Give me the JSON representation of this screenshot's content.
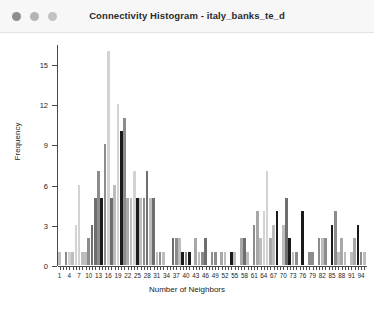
{
  "window": {
    "title": "Connectivity Histogram - italy_banks_te_d",
    "controls": [
      {
        "name": "close",
        "color": "#8e8e8e"
      },
      {
        "name": "minimize",
        "color": "#b4b4b4"
      },
      {
        "name": "maximize",
        "color": "#c2c2c2"
      }
    ]
  },
  "chart_data": {
    "type": "bar",
    "title": "Connectivity Histogram - italy_banks_te_d",
    "xlabel": "Number of Neighbors",
    "ylabel": "Frequency",
    "xlim": [
      0.5,
      95.5
    ],
    "ylim": [
      0,
      16.5
    ],
    "grid": false,
    "legend": null,
    "ytick_labels": [
      "0",
      "3",
      "6",
      "9",
      "12",
      "15"
    ],
    "ytick_values": [
      0,
      3,
      6,
      9,
      12,
      15
    ],
    "xtick_labels": [
      "1",
      "4",
      "7",
      "10",
      "13",
      "16",
      "19",
      "22",
      "25",
      "28",
      "31",
      "34",
      "37",
      "40",
      "43",
      "46",
      "49",
      "52",
      "55",
      "58",
      "61",
      "64",
      "67",
      "70",
      "73",
      "76",
      "79",
      "82",
      "85",
      "88",
      "91",
      "94"
    ],
    "xtick_values": [
      1,
      4,
      7,
      10,
      13,
      16,
      19,
      22,
      25,
      28,
      31,
      34,
      37,
      40,
      43,
      46,
      49,
      52,
      55,
      58,
      61,
      64,
      67,
      70,
      73,
      76,
      79,
      82,
      85,
      88,
      91,
      94
    ],
    "bar_colors": [
      "#bdbdbd",
      "#8c8c8c",
      "#6e6e6e",
      "#d3d3d3",
      "#1a1a1a",
      "#a8a8a8",
      "#5a5a5a"
    ],
    "categories": [
      1,
      2,
      3,
      4,
      5,
      6,
      7,
      8,
      9,
      10,
      11,
      12,
      13,
      14,
      15,
      16,
      17,
      18,
      19,
      20,
      21,
      22,
      23,
      24,
      25,
      26,
      27,
      28,
      29,
      30,
      31,
      32,
      33,
      34,
      35,
      36,
      37,
      38,
      39,
      40,
      41,
      42,
      43,
      44,
      45,
      46,
      47,
      48,
      49,
      50,
      51,
      52,
      53,
      54,
      55,
      56,
      57,
      58,
      59,
      60,
      61,
      62,
      63,
      64,
      65,
      66,
      67,
      68,
      69,
      70,
      71,
      72,
      73,
      74,
      75,
      76,
      77,
      78,
      79,
      80,
      81,
      82,
      83,
      84,
      85,
      86,
      87,
      88,
      89,
      90,
      91,
      92,
      93,
      94,
      95
    ],
    "values": [
      1,
      0,
      1,
      1,
      1,
      3,
      6,
      1,
      1,
      2,
      3,
      5,
      7,
      5,
      9,
      16,
      5,
      6,
      12,
      10,
      11,
      5,
      5,
      7,
      5,
      5,
      5,
      7,
      5,
      5,
      1,
      1,
      1,
      0,
      0,
      2,
      2,
      2,
      1,
      1,
      1,
      0,
      2,
      1,
      1,
      2,
      0,
      1,
      1,
      0,
      1,
      1,
      0,
      1,
      1,
      0,
      2,
      2,
      1,
      0,
      3,
      4,
      2,
      4,
      7,
      2,
      3,
      4,
      0,
      3,
      5,
      2,
      1,
      1,
      0,
      4,
      0,
      1,
      1,
      0,
      2,
      2,
      2,
      0,
      3,
      4,
      1,
      2,
      1,
      0,
      1,
      2,
      3,
      1,
      1
    ],
    "bar_color_index": [
      0,
      0,
      1,
      3,
      0,
      3,
      3,
      0,
      0,
      1,
      2,
      2,
      1,
      4,
      1,
      3,
      2,
      0,
      3,
      4,
      1,
      5,
      0,
      3,
      4,
      0,
      1,
      2,
      0,
      2,
      0,
      1,
      0,
      0,
      0,
      2,
      1,
      0,
      4,
      1,
      4,
      0,
      5,
      0,
      1,
      2,
      0,
      1,
      1,
      0,
      5,
      0,
      0,
      4,
      0,
      0,
      5,
      2,
      0,
      0,
      1,
      5,
      0,
      3,
      3,
      5,
      0,
      4,
      0,
      0,
      2,
      4,
      0,
      1,
      0,
      4,
      0,
      1,
      1,
      0,
      1,
      0,
      1,
      0,
      4,
      1,
      0,
      5,
      0,
      0,
      0,
      5,
      4,
      1,
      0
    ]
  }
}
